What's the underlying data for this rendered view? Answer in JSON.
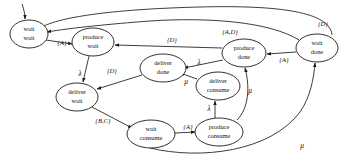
{
  "diagram": {
    "stroke_color": "#1a1a1a",
    "background_color": "#ffffff",
    "nodes": [
      {
        "id": "wait_wait",
        "line1": "wait",
        "line2": "wait",
        "cx": 29,
        "cy": 34,
        "rx": 19,
        "ry": 14
      },
      {
        "id": "produce_wait",
        "line1": "produce",
        "line2": "wait",
        "cx": 93,
        "cy": 42,
        "rx": 21,
        "ry": 14
      },
      {
        "id": "deliver_wait",
        "line1": "deliver",
        "line2": "wait",
        "cx": 77,
        "cy": 97,
        "rx": 21,
        "ry": 14
      },
      {
        "id": "deliver_done",
        "line1": "deliver",
        "line2": "done",
        "cx": 163,
        "cy": 68,
        "rx": 23,
        "ry": 14
      },
      {
        "id": "deliver_consume",
        "line1": "deliver",
        "line2": "consume",
        "cx": 218,
        "cy": 86,
        "rx": 22,
        "ry": 14
      },
      {
        "id": "produce_done",
        "line1": "produce",
        "line2": "done",
        "cx": 244,
        "cy": 53,
        "rx": 22,
        "ry": 14
      },
      {
        "id": "wait_done",
        "line1": "wait",
        "line2": "done",
        "cx": 317,
        "cy": 48,
        "rx": 21,
        "ry": 14
      },
      {
        "id": "wait_consume",
        "line1": "wait",
        "line2": "consume",
        "cx": 151,
        "cy": 134,
        "rx": 24,
        "ry": 14
      },
      {
        "id": "produce_consume",
        "line1": "produce",
        "line2": "consume",
        "cx": 219,
        "cy": 132,
        "rx": 24,
        "ry": 14
      }
    ],
    "edges": [
      {
        "id": "start-to-wait-wait",
        "from": "start",
        "to": "wait_wait",
        "label": ""
      },
      {
        "id": "wait-wait-to-produce-wait",
        "from": "wait_wait",
        "to": "produce_wait",
        "label": "{A}",
        "lx": 62,
        "ly": 43
      },
      {
        "id": "produce-wait-to-deliver-wait",
        "from": "produce_wait",
        "to": "deliver_wait",
        "label": "λ",
        "lx": 80,
        "ly": 74,
        "greek": true
      },
      {
        "id": "deliver-done-to-deliver-wait",
        "from": "deliver_done",
        "to": "deliver_wait",
        "label": "{D}",
        "lx": 112,
        "ly": 71
      },
      {
        "id": "produce-done-to-produce-wait",
        "from": "produce_done",
        "to": "produce_wait",
        "label": "{D}",
        "lx": 172,
        "ly": 40
      },
      {
        "id": "produce-done-to-deliver-done",
        "from": "produce_done",
        "to": "deliver_done",
        "label": "λ",
        "lx": 199,
        "ly": 63,
        "greek": true
      },
      {
        "id": "deliver-consume-to-deliver-done",
        "from": "deliver_consume",
        "to": "deliver_done",
        "label": "μ",
        "lx": 186,
        "ly": 82,
        "greek": true
      },
      {
        "id": "wait-done-to-produce-done",
        "from": "wait_done",
        "to": "produce_done",
        "label": "{A}",
        "lx": 284,
        "ly": 60
      },
      {
        "id": "wait-done-to-wait-wait",
        "from": "wait_done",
        "to": "wait_wait",
        "label": "{D}",
        "lx": 323,
        "ly": 24
      },
      {
        "id": "produce-done-to-wait-wait",
        "from": "produce_done",
        "to": "wait_wait",
        "label": "{A,D}",
        "lx": 230,
        "ly": 32
      },
      {
        "id": "deliver-wait-to-wait-consume",
        "from": "deliver_wait",
        "to": "wait_consume",
        "label": "{B,C}",
        "lx": 103,
        "ly": 121
      },
      {
        "id": "wait-consume-to-produce-consume",
        "from": "wait_consume",
        "to": "produce_consume",
        "label": "{A}",
        "lx": 188,
        "ly": 127
      },
      {
        "id": "produce-consume-to-deliver-consume",
        "from": "produce_consume",
        "to": "deliver_consume",
        "label": "λ",
        "lx": 212,
        "ly": 109,
        "greek": true
      },
      {
        "id": "produce-consume-to-produce-done",
        "from": "produce_consume",
        "to": "produce_done",
        "label": "μ",
        "lx": 250,
        "ly": 91,
        "greek": true
      },
      {
        "id": "produce-consume-to-wait-done",
        "from": "produce_consume",
        "to": "wait_done",
        "label": "μ",
        "lx": 302,
        "ly": 146,
        "greek": true
      }
    ]
  }
}
